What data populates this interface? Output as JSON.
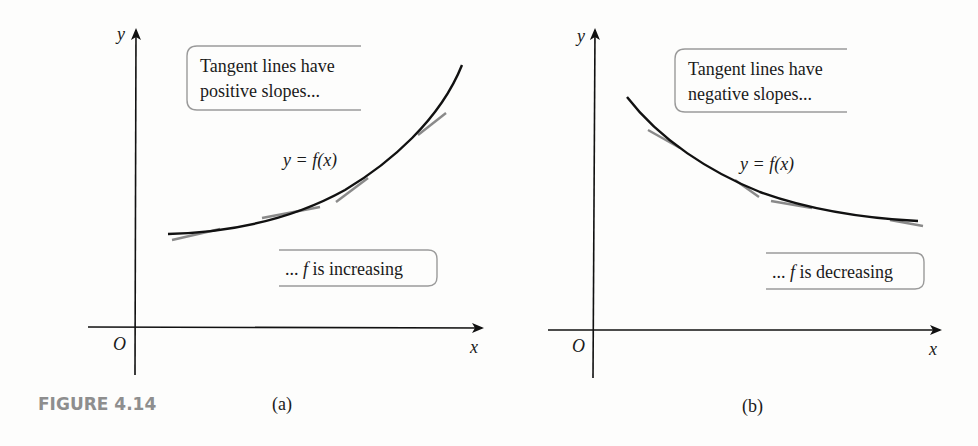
{
  "figure": {
    "label": "FIGURE 4.14",
    "colors": {
      "curve": "#111111",
      "tangent": "#8a8a8a",
      "box_border": "#9a9a9a",
      "figure_label": "#8e8e8e"
    }
  },
  "panels": [
    {
      "id": "a",
      "caption": "(a)",
      "axis": {
        "x_label": "x",
        "y_label": "y",
        "origin_label": "O"
      },
      "curve_label": "y = f(x)",
      "top_note": {
        "line1": "Tangent lines have",
        "line2": "positive slopes..."
      },
      "bottom_note": {
        "prefix": "... ",
        "f": "f",
        "suffix": " is increasing"
      }
    },
    {
      "id": "b",
      "caption": "(b)",
      "axis": {
        "x_label": "x",
        "y_label": "y",
        "origin_label": "O"
      },
      "curve_label": "y = f(x)",
      "top_note": {
        "line1": "Tangent lines have",
        "line2": "negative slopes..."
      },
      "bottom_note": {
        "prefix": "... ",
        "f": "f",
        "suffix": " is decreasing"
      }
    }
  ]
}
